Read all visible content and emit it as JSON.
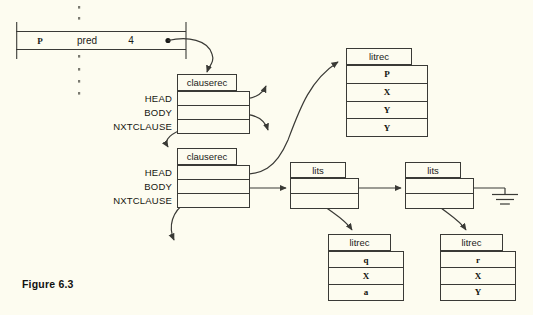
{
  "figure": {
    "caption": "Figure 6.3",
    "background_color": "#fdfcf0",
    "ink_color": "#3a3a36"
  },
  "pred_table": {
    "name": "predicate-entry-strip",
    "cells": [
      {
        "text": "P",
        "style": "serif-bold"
      },
      {
        "text": "pred",
        "style": "sans"
      },
      {
        "text": "4",
        "style": "sans"
      }
    ],
    "pointer_label": "",
    "has_vertical_ellipsis_above": true,
    "has_vertical_ellipsis_below": true
  },
  "clause_records": [
    {
      "header": "clauserec",
      "fields": [
        "HEAD",
        "BODY",
        "NXTCLAUSE"
      ],
      "rows": [
        "",
        "",
        ""
      ]
    },
    {
      "header": "clauserec",
      "fields": [
        "HEAD",
        "BODY",
        "NXTCLAUSE"
      ],
      "rows": [
        "",
        "",
        ""
      ]
    }
  ],
  "literal_records": [
    {
      "header": "litrec",
      "rows": [
        "P",
        "X",
        "Y",
        "Y"
      ]
    },
    {
      "header": "litrec",
      "rows": [
        "q",
        "X",
        "a"
      ]
    },
    {
      "header": "litrec",
      "rows": [
        "r",
        "X",
        "Y"
      ]
    }
  ],
  "lits_cells": [
    {
      "header": "lits",
      "rows": [
        "",
        ""
      ]
    },
    {
      "header": "lits",
      "rows": [
        "",
        ""
      ]
    }
  ],
  "ground_symbol": {
    "name": "nil-pointer-ground",
    "label": ""
  }
}
